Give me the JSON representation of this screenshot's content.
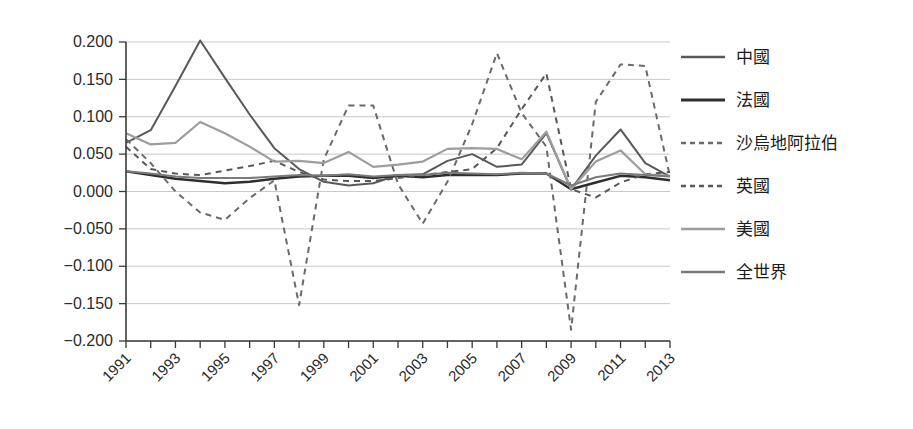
{
  "chart_data": {
    "type": "line",
    "title": "",
    "subtitle": "",
    "xlabel": "",
    "ylabel": "",
    "xlim": [
      1991,
      2013
    ],
    "ylim": [
      -0.2,
      0.2
    ],
    "grid": true,
    "legend_position": "right",
    "x": [
      1991,
      1992,
      1993,
      1994,
      1995,
      1996,
      1997,
      1998,
      1999,
      2000,
      2001,
      2002,
      2003,
      2004,
      2005,
      2006,
      2007,
      2008,
      2009,
      2010,
      2011,
      2012,
      2013
    ],
    "x_tick_labels": [
      "1991",
      "1993",
      "1995",
      "1997",
      "1999",
      "2001",
      "2003",
      "2005",
      "2007",
      "2009",
      "2011",
      "2013"
    ],
    "y_tick_labels": [
      "0.200",
      "0.150",
      "0.100",
      "0.050",
      "0.000",
      "−0.050",
      "−0.100",
      "−0.150",
      "−0.200"
    ],
    "y_ticks": [
      0.2,
      0.15,
      0.1,
      0.05,
      0.0,
      -0.05,
      -0.1,
      -0.15,
      -0.2
    ],
    "series": [
      {
        "name": "中國",
        "key": "china",
        "color": "#595959",
        "width": 2.0,
        "dash": "none",
        "values": [
          0.065,
          0.082,
          0.141,
          0.202,
          0.152,
          0.103,
          0.058,
          0.03,
          0.013,
          0.008,
          0.011,
          0.022,
          0.023,
          0.041,
          0.05,
          0.033,
          0.036,
          0.078,
          0.003,
          0.048,
          0.083,
          0.038,
          0.02
        ]
      },
      {
        "name": "法國",
        "key": "france",
        "color": "#2e2e2e",
        "width": 2.4,
        "dash": "none",
        "values": [
          0.027,
          0.022,
          0.017,
          0.014,
          0.011,
          0.013,
          0.017,
          0.02,
          0.021,
          0.021,
          0.018,
          0.021,
          0.019,
          0.022,
          0.022,
          0.022,
          0.024,
          0.024,
          0.003,
          0.012,
          0.021,
          0.019,
          0.015
        ]
      },
      {
        "name": "沙烏地阿拉伯",
        "key": "saudi_arabia",
        "color": "#6a6a6a",
        "width": 2.0,
        "dash": "6,5",
        "values": [
          0.07,
          0.038,
          0.0,
          -0.028,
          -0.038,
          -0.009,
          0.015,
          -0.152,
          0.043,
          0.115,
          0.115,
          0.01,
          -0.043,
          0.013,
          0.09,
          0.185,
          0.105,
          0.06,
          -0.185,
          0.12,
          0.17,
          0.168,
          0.02
        ]
      },
      {
        "name": "英國",
        "key": "uk",
        "color": "#585858",
        "width": 2.0,
        "dash": "6,5",
        "values": [
          0.06,
          0.03,
          0.024,
          0.022,
          0.028,
          0.034,
          0.041,
          0.026,
          0.016,
          0.014,
          0.014,
          0.018,
          0.022,
          0.026,
          0.03,
          0.058,
          0.11,
          0.158,
          0.003,
          -0.008,
          0.012,
          0.023,
          0.026
        ]
      },
      {
        "name": "美國",
        "key": "usa",
        "color": "#9d9d9d",
        "width": 2.2,
        "dash": "none",
        "values": [
          0.078,
          0.063,
          0.065,
          0.093,
          0.078,
          0.06,
          0.04,
          0.041,
          0.038,
          0.053,
          0.033,
          0.036,
          0.04,
          0.057,
          0.058,
          0.057,
          0.043,
          0.08,
          0.003,
          0.04,
          0.055,
          0.023,
          0.021
        ]
      },
      {
        "name": "全世界",
        "key": "world",
        "color": "#7a7a7a",
        "width": 2.1,
        "dash": "none",
        "values": [
          0.027,
          0.024,
          0.02,
          0.018,
          0.018,
          0.018,
          0.02,
          0.022,
          0.021,
          0.023,
          0.02,
          0.022,
          0.022,
          0.025,
          0.024,
          0.023,
          0.025,
          0.024,
          0.008,
          0.019,
          0.024,
          0.022,
          0.02
        ]
      }
    ]
  },
  "legend": {
    "items": [
      {
        "label": "中國"
      },
      {
        "label": "法國"
      },
      {
        "label": "沙烏地阿拉伯"
      },
      {
        "label": "英國"
      },
      {
        "label": "美國"
      },
      {
        "label": "全世界"
      }
    ]
  },
  "colors": {
    "gridline": "#c9c9c9",
    "axis": "#3a3a3a",
    "text": "#2b2b2b",
    "background": "#ffffff"
  }
}
